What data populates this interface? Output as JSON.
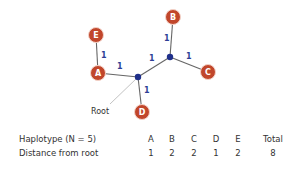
{
  "diagram": {
    "nodes": [
      {
        "id": "A",
        "label": "A",
        "x": 98,
        "y": 73
      },
      {
        "id": "B",
        "label": "B",
        "x": 173,
        "y": 17
      },
      {
        "id": "C",
        "label": "C",
        "x": 208,
        "y": 72
      },
      {
        "id": "D",
        "label": "D",
        "x": 142,
        "y": 112
      },
      {
        "id": "E",
        "label": "E",
        "x": 96,
        "y": 35
      }
    ],
    "junctions": [
      {
        "id": "root",
        "x": 138,
        "y": 77
      },
      {
        "id": "j2",
        "x": 170,
        "y": 57
      }
    ],
    "edges": [
      {
        "from": "E",
        "to": "A",
        "weight": "1"
      },
      {
        "from": "A",
        "to": "root",
        "weight": "1"
      },
      {
        "from": "root",
        "to": "j2",
        "weight": "1"
      },
      {
        "from": "j2",
        "to": "B",
        "weight": "1"
      },
      {
        "from": "j2",
        "to": "C",
        "weight": "1"
      },
      {
        "from": "root",
        "to": "D",
        "weight": "1"
      }
    ],
    "root_label": "Root",
    "colors": {
      "node_fill": "#c1462b",
      "node_stroke": "#f3d2c8",
      "junction": "#1f2f8a",
      "edge": "#666666",
      "edge_label": "#2e3f96"
    }
  },
  "table": {
    "header_label": "Haplotype (N = 5)",
    "row_label": "Distance from root",
    "columns": [
      "A",
      "B",
      "C",
      "D",
      "E",
      "Total"
    ],
    "values": [
      "1",
      "2",
      "2",
      "1",
      "2",
      "8"
    ]
  }
}
